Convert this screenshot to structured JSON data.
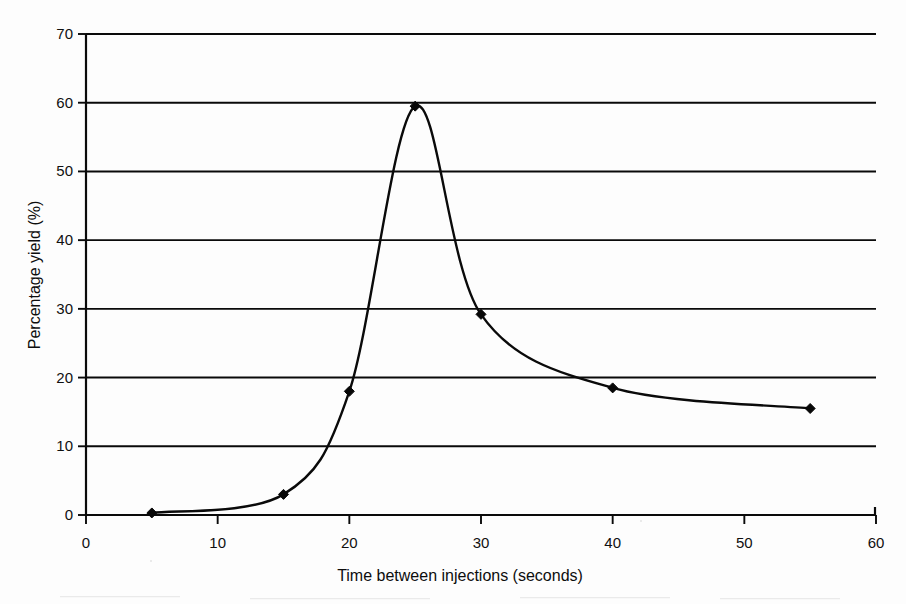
{
  "chart_data": {
    "type": "line",
    "title": "",
    "xlabel": "Time between injections (seconds)",
    "ylabel": "Percentage yield (%)",
    "xlim": [
      0,
      60
    ],
    "ylim": [
      0,
      70
    ],
    "xticks": [
      0,
      10,
      20,
      30,
      40,
      50,
      60
    ],
    "yticks": [
      0,
      10,
      20,
      30,
      40,
      50,
      60,
      70
    ],
    "grid": "horizontal",
    "legend": "none",
    "marker": "diamond",
    "line_color": "#0a0a0a",
    "smoothing": "spline",
    "x": [
      5,
      15,
      20,
      25,
      30,
      40,
      55
    ],
    "values": [
      0.3,
      3.0,
      18.0,
      59.5,
      29.2,
      18.5,
      15.5
    ],
    "series": [
      {
        "name": "Percentage yield",
        "x": [
          5,
          15,
          20,
          25,
          30,
          40,
          55
        ],
        "values": [
          0.3,
          3.0,
          18.0,
          59.5,
          29.2,
          18.5,
          15.5
        ]
      }
    ]
  },
  "axes": {
    "y_title": "Percentage yield (%)",
    "x_title": "Time between injections (seconds)",
    "y_tick_labels": [
      "70",
      "60",
      "50",
      "40",
      "30",
      "20",
      "10",
      "0"
    ],
    "x_tick_labels": [
      "0",
      "10",
      "20",
      "30",
      "40",
      "50",
      "60"
    ]
  }
}
